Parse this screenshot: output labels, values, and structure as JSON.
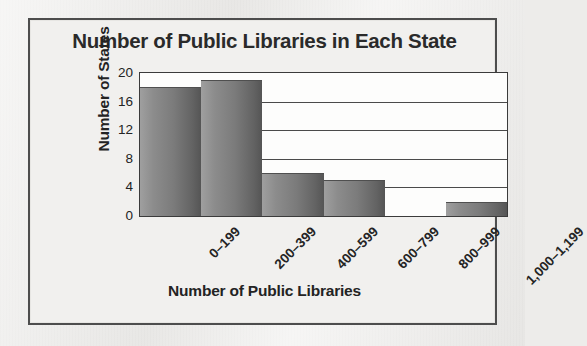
{
  "chart_data": {
    "type": "bar",
    "title": "Number of Public Libraries in Each State",
    "xlabel": "Number of Public Libraries",
    "ylabel": "Number of States",
    "categories": [
      "0–199",
      "200–399",
      "400–599",
      "600–799",
      "800–999",
      "1,000–1,199"
    ],
    "values": [
      18,
      19,
      6,
      5,
      0,
      2
    ],
    "ylim": [
      0,
      20
    ],
    "yticks": [
      0,
      4,
      8,
      12,
      16,
      20
    ],
    "ytick_labels": [
      "0",
      "4",
      "8",
      "12",
      "16",
      "20"
    ],
    "gridlines": [
      4,
      8,
      12,
      16
    ],
    "grid": true,
    "legend": false,
    "bar_color": "#7b7b7b",
    "bar_color_light": "#9f9f9f",
    "bar_color_dark": "#555555",
    "frame_color": "#4d4d4d",
    "background_color": "#edecea",
    "plot_background": "#fdfdfc",
    "text_color": "#232323"
  }
}
